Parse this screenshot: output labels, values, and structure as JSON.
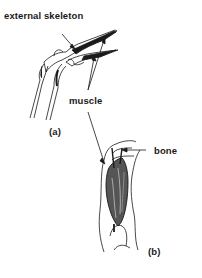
{
  "diagram": {
    "panels": [
      {
        "id": "a",
        "caption": "(a)",
        "subject": "insect limb joint with external skeleton"
      },
      {
        "id": "b",
        "caption": "(b)",
        "subject": "vertebrate limb with internal bone"
      }
    ],
    "labels": {
      "external_skeleton": "external skeleton",
      "muscle": "muscle",
      "bone": "bone",
      "panel_a": "(a)",
      "panel_b": "(b)"
    },
    "colors": {
      "ink": "#1a1a1a",
      "background": "#ffffff"
    }
  }
}
